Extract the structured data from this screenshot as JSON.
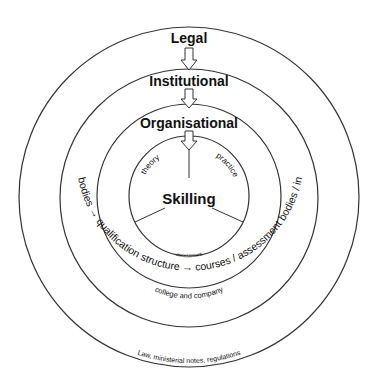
{
  "diagram": {
    "levels": {
      "legal": "Legal",
      "institutional": "Institutional",
      "organisational": "Organisational",
      "core": "Skilling"
    },
    "core_segments": [
      "theory",
      "practice",
      "assessment"
    ],
    "ring_texts": {
      "organisational": "college and company",
      "institutional": "national bodies → qualification structure → courses / assessment bodies / inspection",
      "legal": "Law, ministerial notes, regulations"
    },
    "colors": {
      "line": "#333333",
      "text": "#111111",
      "background": "#ffffff"
    }
  }
}
